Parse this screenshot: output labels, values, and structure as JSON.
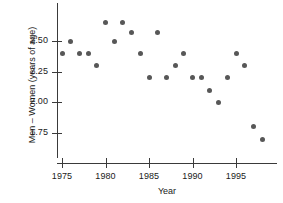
{
  "chart_data": {
    "type": "scatter",
    "title": "",
    "xlabel": "Year",
    "ylabel": "Men – Women (years of age)",
    "xlim": [
      1973.8,
      1999.3
    ],
    "ylim": [
      1.66,
      2.72
    ],
    "grid": false,
    "legend": null,
    "xticks": [
      1975,
      1980,
      1985,
      1990,
      1995
    ],
    "xtick_labels": [
      "1975",
      "1980",
      "1985",
      "1990",
      "1995"
    ],
    "yticks": [
      1.75,
      2.0,
      2.25,
      2.5
    ],
    "ytick_labels": [
      "1.75",
      "2.00",
      "2.25",
      "2.50"
    ],
    "point_color": "#575757",
    "axis_color": "#3a3a3a",
    "background_color": "#ffffff",
    "x": [
      1975,
      1976,
      1977,
      1978,
      1979,
      1980,
      1981,
      1982,
      1983,
      1984,
      1985,
      1986,
      1987,
      1988,
      1989,
      1990,
      1991,
      1992,
      1993,
      1994,
      1995,
      1996,
      1997,
      1998
    ],
    "y": [
      2.4,
      2.5,
      2.4,
      2.4,
      2.3,
      2.65,
      2.5,
      2.65,
      2.57,
      2.4,
      2.2,
      2.57,
      2.2,
      2.3,
      2.4,
      2.2,
      2.2,
      2.1,
      2.0,
      2.2,
      2.4,
      2.3,
      1.8,
      1.7
    ],
    "points": [
      {
        "year": 1975,
        "value": 2.4
      },
      {
        "year": 1976,
        "value": 2.5
      },
      {
        "year": 1977,
        "value": 2.4
      },
      {
        "year": 1978,
        "value": 2.4
      },
      {
        "year": 1979,
        "value": 2.3
      },
      {
        "year": 1980,
        "value": 2.65
      },
      {
        "year": 1981,
        "value": 2.5
      },
      {
        "year": 1982,
        "value": 2.65
      },
      {
        "year": 1983,
        "value": 2.57
      },
      {
        "year": 1984,
        "value": 2.4
      },
      {
        "year": 1985,
        "value": 2.2
      },
      {
        "year": 1986,
        "value": 2.57
      },
      {
        "year": 1987,
        "value": 2.2
      },
      {
        "year": 1988,
        "value": 2.3
      },
      {
        "year": 1989,
        "value": 2.4
      },
      {
        "year": 1990,
        "value": 2.2
      },
      {
        "year": 1991,
        "value": 2.2
      },
      {
        "year": 1992,
        "value": 2.1
      },
      {
        "year": 1993,
        "value": 2.0
      },
      {
        "year": 1994,
        "value": 2.2
      },
      {
        "year": 1995,
        "value": 2.4
      },
      {
        "year": 1996,
        "value": 2.3
      },
      {
        "year": 1997,
        "value": 1.8
      },
      {
        "year": 1998,
        "value": 1.7
      }
    ]
  }
}
